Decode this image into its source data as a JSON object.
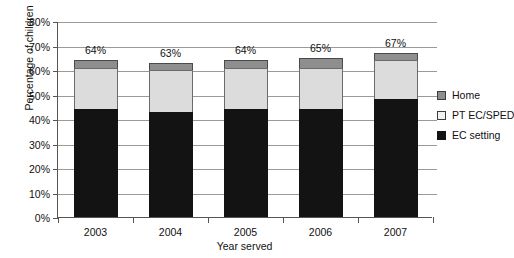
{
  "chart_data": {
    "type": "bar",
    "subtype": "stacked-bar",
    "title": "",
    "xlabel": "Year served",
    "ylabel": "Percentage of children",
    "categories": [
      "2003",
      "2004",
      "2005",
      "2006",
      "2007"
    ],
    "ylim": [
      0,
      80
    ],
    "ytick_labels": [
      "0%",
      "10%",
      "20%",
      "30%",
      "40%",
      "50%",
      "60%",
      "70%",
      "80%"
    ],
    "ytick_values": [
      0,
      10,
      20,
      30,
      40,
      50,
      60,
      70,
      80
    ],
    "grid": true,
    "legend_position": "right",
    "series": [
      {
        "name": "EC setting",
        "color": "#131313",
        "values": [
          44,
          43,
          44,
          44,
          48
        ]
      },
      {
        "name": "PT EC/SPED",
        "color": "#dcdcdc",
        "values": [
          17,
          17,
          17,
          17,
          16
        ]
      },
      {
        "name": "Home",
        "color": "#8e8e8e",
        "values": [
          3,
          3,
          3,
          4,
          3
        ]
      }
    ],
    "totals": [
      64,
      63,
      64,
      65,
      67
    ],
    "total_labels": [
      "64%",
      "63%",
      "64%",
      "65%",
      "67%"
    ]
  },
  "legend": {
    "items": [
      {
        "label": "Home",
        "swatch": "home-swatch"
      },
      {
        "label": "PT EC/SPED",
        "swatch": "pt-ec-sped-swatch"
      },
      {
        "label": "EC setting",
        "swatch": "ec-setting-swatch"
      }
    ]
  },
  "colors": {
    "ec_setting": "#131313",
    "pt_ec_sped": "#dcdcdc",
    "home": "#8e8e8e",
    "gridline": "#9a9a9a",
    "axis": "#555555"
  }
}
